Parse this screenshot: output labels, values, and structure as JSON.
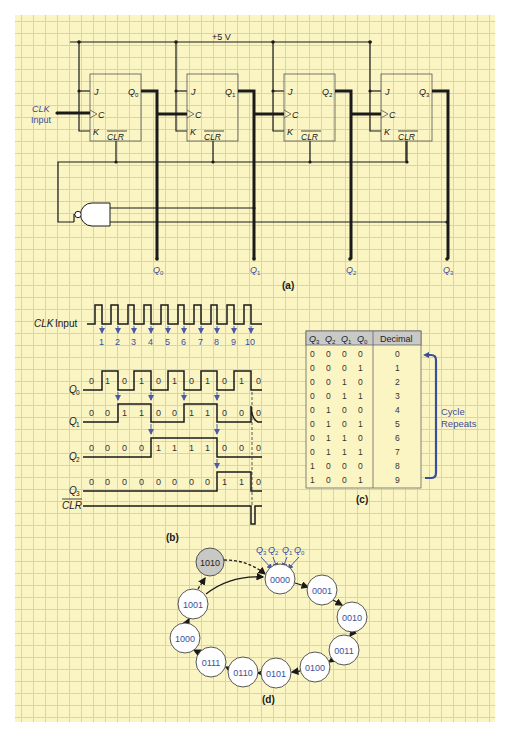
{
  "figure": {
    "background_color": "#fbf5c4",
    "accent_color": "#3b4e9b",
    "panels": {
      "a": {
        "caption": "(a)",
        "supply_label": "+5 V",
        "clk_label_line1": "CLK",
        "clk_label_line2": "Input",
        "flip_flops": [
          {
            "j": "J",
            "c": "C",
            "k": "K",
            "clr": "CLR",
            "q": "Q",
            "q_sub": "0"
          },
          {
            "j": "J",
            "c": "C",
            "k": "K",
            "clr": "CLR",
            "q": "Q",
            "q_sub": "1"
          },
          {
            "j": "J",
            "c": "C",
            "k": "K",
            "clr": "CLR",
            "q": "Q",
            "q_sub": "2"
          },
          {
            "j": "J",
            "c": "C",
            "k": "K",
            "clr": "CLR",
            "q": "Q",
            "q_sub": "3"
          }
        ],
        "outputs": [
          {
            "q": "Q",
            "sub": "0"
          },
          {
            "q": "Q",
            "sub": "1"
          },
          {
            "q": "Q",
            "sub": "2"
          },
          {
            "q": "Q",
            "sub": "3"
          }
        ],
        "gate": "NAND",
        "gate_inputs": [
          "Q1",
          "Q3"
        ]
      },
      "b": {
        "caption": "(b)",
        "clk_label_italic": "CLK",
        "clk_label_rest": " Input",
        "clock_pulses": [
          "1",
          "2",
          "3",
          "4",
          "5",
          "6",
          "7",
          "8",
          "9",
          "10"
        ],
        "signals": [
          {
            "name": "Q",
            "sub": "0",
            "bits": [
              "0",
              "1",
              "0",
              "1",
              "0",
              "1",
              "0",
              "1",
              "0",
              "1",
              "0"
            ]
          },
          {
            "name": "Q",
            "sub": "1",
            "bits": [
              "0",
              "0",
              "1",
              "1",
              "0",
              "0",
              "1",
              "1",
              "0",
              "0",
              "0"
            ]
          },
          {
            "name": "Q",
            "sub": "2",
            "bits": [
              "0",
              "0",
              "0",
              "0",
              "1",
              "1",
              "1",
              "1",
              "0",
              "0",
              "0"
            ]
          },
          {
            "name": "Q",
            "sub": "3",
            "bits": [
              "0",
              "0",
              "0",
              "0",
              "0",
              "0",
              "0",
              "0",
              "1",
              "1",
              "0"
            ]
          }
        ],
        "clr_label": "CLR"
      },
      "c": {
        "caption": "(c)",
        "headers": [
          {
            "q": "Q",
            "sub": "3"
          },
          {
            "q": "Q",
            "sub": "2"
          },
          {
            "q": "Q",
            "sub": "1"
          },
          {
            "q": "Q",
            "sub": "0"
          }
        ],
        "decimal_header": "Decimal",
        "rows": [
          {
            "bits": [
              "0",
              "0",
              "0",
              "0"
            ],
            "decimal": "0"
          },
          {
            "bits": [
              "0",
              "0",
              "0",
              "1"
            ],
            "decimal": "1"
          },
          {
            "bits": [
              "0",
              "0",
              "1",
              "0"
            ],
            "decimal": "2"
          },
          {
            "bits": [
              "0",
              "0",
              "1",
              "1"
            ],
            "decimal": "3"
          },
          {
            "bits": [
              "0",
              "1",
              "0",
              "0"
            ],
            "decimal": "4"
          },
          {
            "bits": [
              "0",
              "1",
              "0",
              "1"
            ],
            "decimal": "5"
          },
          {
            "bits": [
              "0",
              "1",
              "1",
              "0"
            ],
            "decimal": "6"
          },
          {
            "bits": [
              "0",
              "1",
              "1",
              "1"
            ],
            "decimal": "7"
          },
          {
            "bits": [
              "1",
              "0",
              "0",
              "0"
            ],
            "decimal": "8"
          },
          {
            "bits": [
              "1",
              "0",
              "0",
              "1"
            ],
            "decimal": "9"
          }
        ],
        "bracket_label_line1": "Cycle",
        "bracket_label_line2": "Repeats"
      },
      "d": {
        "caption": "(d)",
        "bit_labels": [
          {
            "q": "Q",
            "sub": "3"
          },
          {
            "q": "Q",
            "sub": "2"
          },
          {
            "q": "Q",
            "sub": "1"
          },
          {
            "q": "Q",
            "sub": "0"
          }
        ],
        "states": [
          "0000",
          "0001",
          "0010",
          "0011",
          "0100",
          "0101",
          "0110",
          "0111",
          "1000",
          "1001"
        ],
        "transient_state": "1010"
      }
    }
  }
}
